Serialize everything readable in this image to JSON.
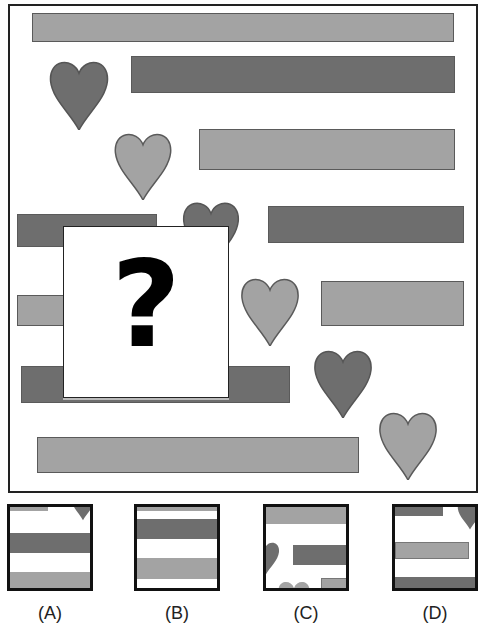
{
  "puzzle": {
    "question_mark": "?",
    "colors": {
      "light": "#a3a3a3",
      "dark": "#6e6e6e",
      "border": "#222222"
    },
    "shapes": [
      {
        "type": "bar",
        "shade": "light",
        "x": 32,
        "y": 13,
        "w": 422,
        "h": 29
      },
      {
        "type": "heart",
        "shade": "dark",
        "x": 48,
        "y": 57
      },
      {
        "type": "bar",
        "shade": "dark",
        "x": 131,
        "y": 56,
        "w": 324,
        "h": 37
      },
      {
        "type": "heart",
        "shade": "light",
        "x": 113,
        "y": 129
      },
      {
        "type": "bar",
        "shade": "light",
        "x": 199,
        "y": 129,
        "w": 256,
        "h": 41
      },
      {
        "type": "bar",
        "shade": "dark",
        "x": 17,
        "y": 214,
        "w": 140,
        "h": 33
      },
      {
        "type": "heart",
        "shade": "dark",
        "x": 180,
        "y": 198
      },
      {
        "type": "bar",
        "shade": "dark",
        "x": 268,
        "y": 206,
        "w": 196,
        "h": 37
      },
      {
        "type": "bar",
        "shade": "light",
        "x": 17,
        "y": 295,
        "w": 50,
        "h": 31
      },
      {
        "type": "heart",
        "shade": "light",
        "x": 240,
        "y": 274
      },
      {
        "type": "bar",
        "shade": "light",
        "x": 321,
        "y": 281,
        "w": 143,
        "h": 45
      },
      {
        "type": "bar",
        "shade": "dark",
        "x": 21,
        "y": 366,
        "w": 269,
        "h": 37
      },
      {
        "type": "heart",
        "shade": "dark",
        "x": 313,
        "y": 346
      },
      {
        "type": "bar",
        "shade": "light",
        "x": 37,
        "y": 437,
        "w": 322,
        "h": 36
      },
      {
        "type": "heart",
        "shade": "light",
        "x": 378,
        "y": 408
      }
    ]
  },
  "options": [
    {
      "label": "(A)",
      "x": 7
    },
    {
      "label": "(B)",
      "x": 134
    },
    {
      "label": "(C)",
      "x": 263
    },
    {
      "label": "(D)",
      "x": 392
    }
  ]
}
